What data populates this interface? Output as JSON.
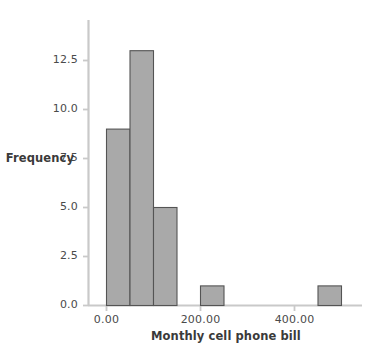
{
  "chart_data": {
    "type": "bar",
    "title": "",
    "subtitle": "",
    "xlabel": "Monthly cell phone bill",
    "ylabel": "Frequency",
    "grid": false,
    "legend": false,
    "legend_position": "none",
    "xlim": [
      -25,
      525
    ],
    "ylim": [
      0,
      13.8
    ],
    "xticks": [
      0,
      200,
      400
    ],
    "xtick_labels": [
      "0.00",
      "200.00",
      "400.00"
    ],
    "yticks": [
      0.0,
      2.5,
      5.0,
      7.5,
      10.0,
      12.5
    ],
    "ytick_labels": [
      "0.0",
      "2.5",
      "5.0",
      "7.5",
      "10.0",
      "12.5"
    ],
    "bin_width": 50,
    "categories": [
      "0-50",
      "50-100",
      "100-150",
      "150-200",
      "200-250",
      "250-300",
      "300-350",
      "350-400",
      "400-450",
      "450-500"
    ],
    "bins": [
      {
        "start": 0,
        "end": 50,
        "value": 9
      },
      {
        "start": 50,
        "end": 100,
        "value": 13
      },
      {
        "start": 100,
        "end": 150,
        "value": 5
      },
      {
        "start": 150,
        "end": 200,
        "value": 0
      },
      {
        "start": 200,
        "end": 250,
        "value": 1
      },
      {
        "start": 250,
        "end": 300,
        "value": 0
      },
      {
        "start": 300,
        "end": 350,
        "value": 0
      },
      {
        "start": 350,
        "end": 400,
        "value": 0
      },
      {
        "start": 400,
        "end": 450,
        "value": 0
      },
      {
        "start": 450,
        "end": 500,
        "value": 1
      }
    ],
    "values": [
      9,
      13,
      5,
      0,
      1,
      0,
      0,
      0,
      0,
      1
    ],
    "colors": {
      "bar_fill": "#a9a9a9",
      "bar_edge": "#545454",
      "axis": "#c9c9c9",
      "tick_text": "#4a4a4a",
      "title_text": "#3a3a3a",
      "background": "#ffffff"
    }
  },
  "axes": {
    "y": {
      "label": "Frequency",
      "ticks": [
        {
          "value": "12.5"
        },
        {
          "value": "10.0"
        },
        {
          "value": "7.5"
        },
        {
          "value": "5.0"
        },
        {
          "value": "2.5"
        },
        {
          "value": "0.0"
        }
      ]
    },
    "x": {
      "label": "Monthly cell phone bill",
      "ticks": [
        {
          "value": "0.00"
        },
        {
          "value": "200.00"
        },
        {
          "value": "400.00"
        }
      ]
    }
  }
}
